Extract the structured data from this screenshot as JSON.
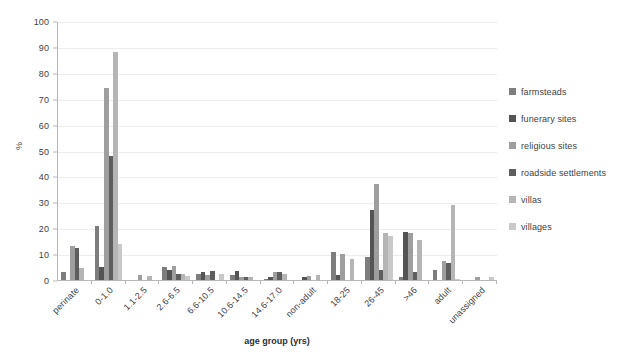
{
  "chart_data": {
    "type": "bar",
    "title": "",
    "xlabel": "age group (yrs)",
    "ylabel": "%",
    "ylim": [
      0,
      100
    ],
    "ytick_step": 10,
    "yticks": [
      100,
      90,
      80,
      70,
      60,
      50,
      40,
      30,
      20,
      10,
      0
    ],
    "grid": true,
    "legend_position": "right",
    "categories": [
      "perinate",
      "0-1.0",
      "1.1-2.5",
      "2.6-6.5",
      "6.6-10.5",
      "10.6-14.5",
      "14.6-17.0",
      "non-adult",
      "18-25",
      "26-45",
      ">46",
      "adult",
      "unassigned"
    ],
    "series": [
      {
        "name": "farmsteads",
        "color": "#7d7d7d",
        "values": [
          3,
          21,
          0,
          5,
          2.5,
          2,
          0.5,
          0,
          11,
          9,
          1,
          4,
          0
        ]
      },
      {
        "name": "funerary sites",
        "color": "#545454",
        "values": [
          0,
          5,
          0,
          4,
          3,
          3.5,
          1,
          1,
          2,
          27,
          18.5,
          0,
          0
        ]
      },
      {
        "name": "religious sites",
        "color": "#9e9e9e",
        "values": [
          13,
          74,
          2,
          5.5,
          2,
          1,
          3,
          1.5,
          10,
          37,
          18,
          7.5,
          1
        ]
      },
      {
        "name": "roadside settlements",
        "color": "#5e5e5e",
        "values": [
          12.5,
          48,
          0,
          2.5,
          3.5,
          1,
          3,
          0,
          0,
          4,
          3,
          6.5,
          0
        ]
      },
      {
        "name": "villas",
        "color": "#b5b5b5",
        "values": [
          4.5,
          88,
          1.5,
          2.5,
          0,
          1,
          2.5,
          2,
          8,
          18,
          15.5,
          29,
          0
        ]
      },
      {
        "name": "villages",
        "color": "#c9c9c9",
        "values": [
          0,
          14,
          0,
          1.5,
          2.5,
          0,
          0,
          0,
          0,
          17,
          0,
          0.5,
          1
        ]
      }
    ]
  }
}
